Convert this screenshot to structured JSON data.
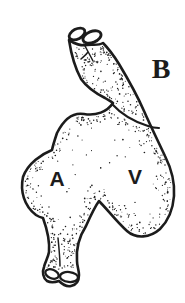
{
  "figure": {
    "panel_label": "B",
    "chamber_labels": {
      "atrium": "A",
      "ventricle": "V"
    },
    "ink_color": "#1c1c1c",
    "background_color": "#ffffff"
  }
}
